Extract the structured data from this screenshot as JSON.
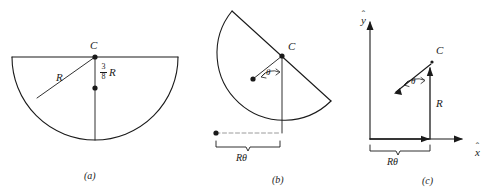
{
  "figure": {
    "background_color": "#ffffff",
    "line_color": "#1a1a1a",
    "panels": [
      {
        "id": "a",
        "caption": "(a)",
        "description": "Semicircle resting with flat diameter horizontal on top; center point C on the diameter; centroid marked 3/8 R below C.",
        "labels": {
          "center_point": "C",
          "radius": "R",
          "centroid_offset_numerator": "3",
          "centroid_offset_denominator": "8",
          "centroid_offset_variable": "R"
        }
      },
      {
        "id": "b",
        "caption": "(b)",
        "description": "Semicircle rotated by angle theta; contact point shifted along the ground by arc length R-theta.",
        "labels": {
          "center_point": "C",
          "angle": "θ",
          "arc_length": "Rθ"
        }
      },
      {
        "id": "c",
        "caption": "(c)",
        "description": "Vector diagram in x-hat, y-hat coordinates: horizontal displacement R-theta, vertical vector R, and centroid offset vector at angle theta to point C.",
        "labels": {
          "center_point": "C",
          "angle": "θ",
          "vertical_vector": "R",
          "horizontal_span": "Rθ",
          "x_axis": "x",
          "x_axis_accent": "ˆ",
          "y_axis": "y",
          "y_axis_accent": "ˆ"
        }
      }
    ]
  }
}
